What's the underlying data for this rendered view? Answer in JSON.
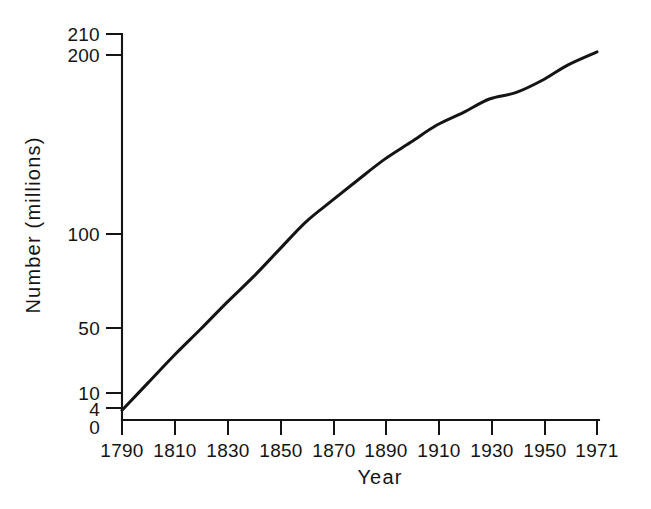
{
  "chart_data": {
    "type": "line",
    "title": "",
    "subtitle": "",
    "xlabel": "Year",
    "ylabel": "Number (millions)",
    "yscale": "log",
    "xscale": "linear",
    "grid": false,
    "legend": null,
    "legend_position": "none",
    "xlim": [
      1790,
      1971
    ],
    "ylim": [
      4,
      210
    ],
    "xticklabels": [
      "1790",
      "1810",
      "1830",
      "1850",
      "1870",
      "1890",
      "1910",
      "1930",
      "1950",
      "1971"
    ],
    "xtickvalues": [
      1790,
      1810,
      1830,
      1850,
      1870,
      1890,
      1910,
      1930,
      1950,
      1971
    ],
    "yticklabels": [
      "210",
      "200",
      "100",
      "50",
      "10",
      "4",
      "0"
    ],
    "ytickvalues": [
      210,
      200,
      100,
      50,
      10,
      4,
      0
    ],
    "series": [
      {
        "name": "Population",
        "color": "#141414",
        "x": [
          1790,
          1800,
          1810,
          1820,
          1830,
          1840,
          1850,
          1860,
          1870,
          1880,
          1890,
          1900,
          1910,
          1920,
          1930,
          1940,
          1950,
          1960,
          1971
        ],
        "values": [
          3.9,
          5.3,
          7.2,
          9.6,
          12.9,
          17.1,
          23.2,
          31.4,
          39.8,
          50.2,
          62.9,
          76.0,
          92.0,
          105.7,
          122.8,
          131.7,
          150.7,
          179.3,
          207.0
        ]
      }
    ],
    "annotations": []
  },
  "figure": {
    "background": "#ffffff",
    "axis_color": "#141414",
    "curve_color": "#141414"
  }
}
